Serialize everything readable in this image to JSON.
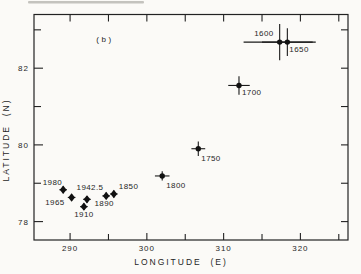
{
  "figure": {
    "panel_label": "(b)",
    "ink_color": "#1f1f1f",
    "background_color": "#fbfaf7"
  },
  "chart_data": {
    "type": "scatter",
    "title": "",
    "panel": "(b)",
    "xlabel": "LONGITUDE  (E)",
    "ylabel": "LATITUDE  (N)",
    "xlim": [
      285.3,
      326.2
    ],
    "ylim": [
      77.52,
      83.4
    ],
    "grid": false,
    "legend_position": "none",
    "x_ticks": [
      290,
      295,
      300,
      305,
      310,
      315,
      320,
      325
    ],
    "x_labeled_ticks": [
      290,
      300,
      310,
      320
    ],
    "y_ticks": [
      78,
      79,
      80,
      81,
      82,
      83
    ],
    "y_labeled_ticks": [
      78,
      80,
      82
    ],
    "points": [
      {
        "year": "1600",
        "lon": 317.3,
        "lat": 82.68,
        "xerr": 4.7,
        "yerr": 0.47,
        "marker": "circle",
        "label": {
          "anchor": "end",
          "dx": -6,
          "dy": -6
        }
      },
      {
        "year": "1650",
        "lon": 318.3,
        "lat": 82.68,
        "xerr": 3.3,
        "yerr": 0.36,
        "marker": "circle",
        "label": {
          "anchor": "start",
          "dx": 2,
          "dy": 10
        }
      },
      {
        "year": "1700",
        "lon": 312.0,
        "lat": 81.55,
        "xerr": 1.4,
        "yerr": 0.24,
        "marker": "circle",
        "label": {
          "anchor": "start",
          "dx": 3,
          "dy": 10
        }
      },
      {
        "year": "1750",
        "lon": 306.7,
        "lat": 79.9,
        "xerr": 0.9,
        "yerr": 0.19,
        "marker": "circle",
        "label": {
          "anchor": "start",
          "dx": 3,
          "dy": 12
        }
      },
      {
        "year": "1800",
        "lon": 302.0,
        "lat": 79.19,
        "xerr": 0.95,
        "yerr": 0.12,
        "marker": "circle",
        "label": {
          "anchor": "start",
          "dx": 4,
          "dy": 12
        }
      },
      {
        "year": "1850",
        "lon": 295.7,
        "lat": 78.72,
        "xerr": 0.5,
        "yerr": 0.09,
        "marker": "diamond",
        "label": {
          "anchor": "start",
          "dx": 5,
          "dy": -5
        }
      },
      {
        "year": "1890",
        "lon": 294.7,
        "lat": 78.67,
        "xerr": 0.5,
        "yerr": 0.09,
        "marker": "diamond",
        "label": {
          "anchor": "middle",
          "dx": -2,
          "dy": 10
        }
      },
      {
        "year": "1910",
        "lon": 291.8,
        "lat": 78.39,
        "xerr": 0.5,
        "yerr": 0.09,
        "marker": "diamond",
        "label": {
          "anchor": "middle",
          "dx": 0,
          "dy": 10
        }
      },
      {
        "year": "1942.5",
        "lon": 292.2,
        "lat": 78.58,
        "xerr": 0.5,
        "yerr": 0.09,
        "marker": "diamond",
        "label": {
          "anchor": "middle",
          "dx": 3,
          "dy": -9
        }
      },
      {
        "year": "1965",
        "lon": 290.2,
        "lat": 78.63,
        "xerr": 0.5,
        "yerr": 0.09,
        "marker": "diamond",
        "label": {
          "anchor": "end",
          "dx": -7,
          "dy": 8
        }
      },
      {
        "year": "1980",
        "lon": 289.1,
        "lat": 78.83,
        "xerr": 0.5,
        "yerr": 0.09,
        "marker": "diamond",
        "label": {
          "anchor": "end",
          "dx": -1,
          "dy": -5
        }
      }
    ]
  }
}
